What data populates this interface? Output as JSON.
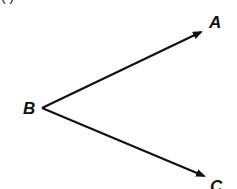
{
  "diagram": {
    "type": "angle",
    "top_fragment": "( )",
    "vertex": {
      "label": "B",
      "x": 42,
      "y": 108
    },
    "rays": [
      {
        "name": "ray-BA",
        "from": "B",
        "to": "A",
        "label": "A",
        "end": {
          "x": 202,
          "y": 31
        }
      },
      {
        "name": "ray-BC",
        "from": "B",
        "to": "C",
        "label": "C",
        "end": {
          "x": 205,
          "y": 178
        }
      }
    ],
    "stroke_color": "#111111",
    "background": "#ffffff"
  }
}
